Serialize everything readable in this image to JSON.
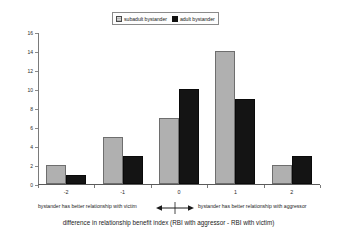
{
  "chart_data": {
    "type": "bar",
    "title": "",
    "categories": [
      "-2",
      "-1",
      "0",
      "1",
      "2"
    ],
    "series": [
      {
        "name": "subadult bystander",
        "values": [
          2,
          5,
          7,
          14,
          2
        ],
        "color": "#b0b0b0"
      },
      {
        "name": "adult bystander",
        "values": [
          1,
          3,
          10,
          9,
          3
        ],
        "color": "#141414"
      }
    ],
    "xlabel": "difference in relationship benefit index (RBI with aggressor - RBI with victim)",
    "ylabel": "# of post-conflict affiliations",
    "ylim": [
      0,
      16
    ],
    "ytick_labels": [
      "16",
      "14",
      "12",
      "10",
      "8",
      "6",
      "4",
      "2",
      "0"
    ],
    "ytick_values": [
      16,
      14,
      12,
      10,
      8,
      6,
      4,
      2,
      0
    ],
    "ytick_step": 2,
    "grid": false,
    "legend_position": "top-center",
    "annotations": [
      {
        "id": "left",
        "text": "bystander has better relationship with victim"
      },
      {
        "id": "right",
        "text": "bystander has better relationship with aggressor"
      },
      {
        "id": "arrow",
        "text": "double-headed-arrow"
      }
    ]
  },
  "legend": {
    "items": [
      {
        "label": "subadult bystander",
        "swatch": "gray-hatched-square"
      },
      {
        "label": "adult bystander",
        "swatch": "black-square"
      }
    ]
  },
  "axes": {
    "x_title": "difference in relationship benefit index (RBI with aggressor - RBI with victim)",
    "y_title": "# of post-conflict affiliations",
    "x_tick_labels": [
      "-2",
      "-1",
      "0",
      "1",
      "2"
    ],
    "y_tick_labels": [
      "16",
      "14",
      "12",
      "10",
      "8",
      "6",
      "4",
      "2",
      "0"
    ]
  },
  "annotations": {
    "left": "bystander has better relationship with victim",
    "right": "bystander has better relationship with aggressor"
  }
}
